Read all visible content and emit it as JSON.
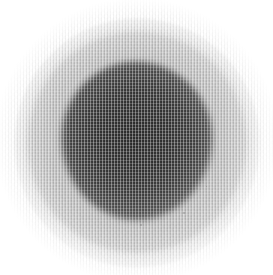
{
  "image": {
    "title": "Grayscale radial blob on white field",
    "width": 273,
    "height": 275,
    "modality": "grayscale-raster",
    "background_color": "#ffffff",
    "core_color": "#3c3c3c",
    "core_inner_color": "#2d2d2d",
    "halo_color": "#d9d9d9",
    "halo_mid_color": "#c2c2c2",
    "texture": "fine-woven-halftone-grid",
    "texture_period_px": 3
  },
  "regions": {
    "background": {
      "label": "paper-white field",
      "color": "#ffffff",
      "extent": "corners and outer margin"
    },
    "halo_outer": {
      "label": "outer diffuse halo",
      "color": "#e2e2e2",
      "center_x": 137,
      "center_y": 143,
      "radius_x": 123,
      "radius_y": 125
    },
    "halo_mid": {
      "label": "inner halo ring",
      "color": "#c9c9c9",
      "center_x": 137,
      "center_y": 142,
      "radius_x": 109,
      "radius_y": 110
    },
    "core": {
      "label": "dark central blob",
      "color": "#3f3f3f",
      "center_x": 137,
      "center_y": 141,
      "radius_x": 75,
      "radius_y": 79
    },
    "core_inner": {
      "label": "darkest core mass",
      "color": "#2e2e2e",
      "center_x": 138,
      "center_y": 143,
      "radius_x": 60,
      "radius_y": 63
    }
  },
  "specks": [
    {
      "name": "speck-lower-right",
      "x": 183,
      "y": 212,
      "size": 2
    },
    {
      "name": "speck-lower-center",
      "x": 140,
      "y": 224,
      "size": 2
    },
    {
      "name": "speck-mid-right",
      "x": 206,
      "y": 186,
      "size": 1
    }
  ],
  "chart_data": {
    "type": "heatmap",
    "xlabel": "",
    "ylabel": "",
    "grid": false,
    "legend": "none",
    "xlim": [
      0,
      273
    ],
    "ylim": [
      0,
      275
    ],
    "radial_profile": {
      "radius_px": [
        0,
        10,
        20,
        30,
        40,
        50,
        60,
        70,
        75,
        80,
        85,
        90,
        100,
        110,
        120,
        130,
        137
      ],
      "gray_value": [
        60,
        61,
        62,
        64,
        67,
        72,
        82,
        108,
        128,
        156,
        182,
        202,
        222,
        236,
        247,
        253,
        255
      ],
      "note": "gray_value is 0-255 luminance sampled outward from blob center"
    }
  }
}
